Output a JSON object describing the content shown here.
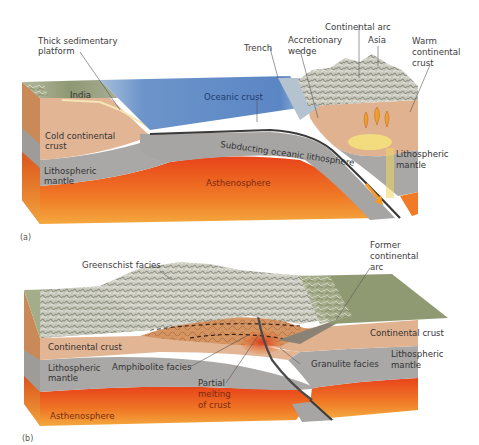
{
  "figure": {
    "panel_a": {
      "panel_label": "(a)",
      "labels": {
        "thick_sedimentary_platform": [
          "Thick sedimentary",
          "platform"
        ],
        "india": "India",
        "oceanic_crust": "Oceanic crust",
        "trench": "Trench",
        "accretionary_wedge": [
          "Accretionary",
          "wedge"
        ],
        "continental_arc": "Continental arc",
        "asia": "Asia",
        "warm_continental_crust": [
          "Warm",
          "continental",
          "crust"
        ],
        "cold_continental_crust": [
          "Cold continental",
          "crust"
        ],
        "subducting_oceanic_lithosphere": "Subducting oceanic lithosphere",
        "lithospheric_mantle_left": [
          "Lithospheric",
          "mantle"
        ],
        "lithospheric_mantle_right": [
          "Lithospheric",
          "mantle"
        ],
        "asthenosphere": "Asthenosphere"
      }
    },
    "panel_b": {
      "panel_label": "(b)",
      "labels": {
        "greenschist_facies": "Greenschist facies",
        "former_continental_arc": [
          "Former",
          "continental",
          "arc"
        ],
        "continental_crust_left": "Continental crust",
        "continental_crust_right": "Continental crust",
        "lithospheric_mantle_left": [
          "Lithospheric",
          "mantle"
        ],
        "lithospheric_mantle_right": [
          "Lithospheric",
          "mantle"
        ],
        "amphibolite_facies": "Amphibolite facies",
        "granulite_facies": "Granulite facies",
        "partial_melting": [
          "Partial",
          "melting",
          "of crust"
        ],
        "asthenosphere": "Asthenosphere"
      }
    },
    "colors": {
      "ocean": "#5b86c4",
      "ocean_light": "#a9c4de",
      "continental_crust": "#e2b595",
      "lithospheric_mantle": "#a9a8a6",
      "asthenosphere": "#ee5a1e",
      "asthenosphere_light": "#f6b24a",
      "terrain_green": "#8f9a73",
      "oceanic_slab": "#3a3a3a",
      "magma": "#f0a030"
    }
  }
}
